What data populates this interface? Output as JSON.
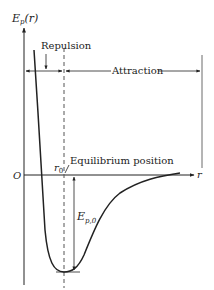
{
  "diagram": {
    "type": "potential-energy-curve",
    "y_axis_label": "E_p(r)",
    "y_axis_label_main": "E",
    "y_axis_label_sub": "p",
    "y_axis_label_arg": "(r)",
    "x_axis_label": "r",
    "origin_label": "O",
    "regions": {
      "repulsion": "Repulsion",
      "attraction": "Attraction"
    },
    "equilibrium_label": "Equilibrium position",
    "r0_label_main": "r",
    "r0_label_sub": "0",
    "well_depth_label_main": "E",
    "well_depth_label_sub": "p,0",
    "colors": {
      "ink": "#222222",
      "background": "#ffffff",
      "dashed": "#555555"
    }
  }
}
